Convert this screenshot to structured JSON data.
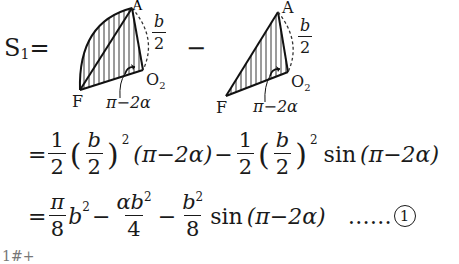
{
  "header": {
    "lhs_symbol": "S",
    "lhs_subscript": "1",
    "equals": "=",
    "minus": "−"
  },
  "figure1": {
    "label_A": "A",
    "label_F": "F",
    "label_O": "O",
    "label_O_sub": "2",
    "radius_num": "b",
    "radius_den": "2",
    "angle_label": "π−2α",
    "shape": "circular-sector-hatched"
  },
  "figure2": {
    "label_A": "A",
    "label_F": "F",
    "label_O": "O",
    "label_O_sub": "2",
    "radius_num": "b",
    "radius_den": "2",
    "angle_label": "π−2α",
    "shape": "triangle-hatched"
  },
  "line1": {
    "eq": "=",
    "half_num": "1",
    "half_den": "2",
    "b_num": "b",
    "b_den": "2",
    "sq": "2",
    "angle_term": "(π−2α)",
    "minus": "−",
    "half2_num": "1",
    "half2_den": "2",
    "b2_num": "b",
    "b2_den": "2",
    "sq2": "2",
    "sin": "sin",
    "sin_arg": "(π−2α)"
  },
  "line2": {
    "eq": "=",
    "pi_num": "π",
    "pi_den": "8",
    "b": "b",
    "sq": "2",
    "minus1": "−",
    "ab_num": "αb",
    "ab_sq": "2",
    "ab_den": "4",
    "minus2": "−",
    "b2_num": "b",
    "b2_sq": "2",
    "b2_den": "8",
    "sin": "sin",
    "sin_arg": "(π−2α)",
    "dots": "……",
    "eq_number": "1"
  },
  "footer": {
    "partial_text": "1#+"
  }
}
